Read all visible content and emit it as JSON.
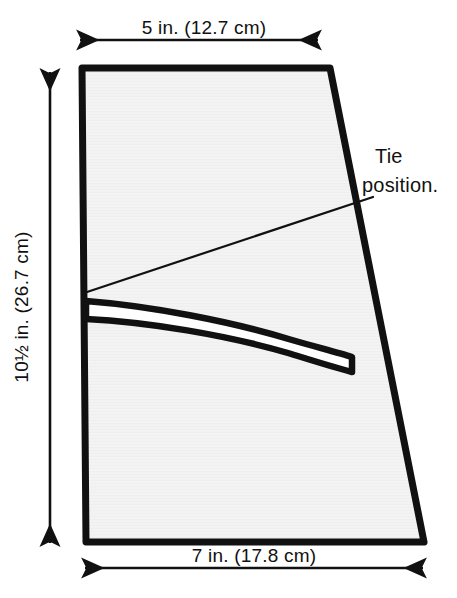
{
  "figure": {
    "background_color": "#ffffff",
    "ink_color": "#111111",
    "panel_fill_color": "#f2f2f2",
    "panel_stroke_color": "#111111"
  },
  "dimensions": {
    "top": {
      "label": "5 in. (12.7 cm)",
      "value_inches": "5",
      "value_cm": "12.7",
      "orientation": "horizontal",
      "arrow_style": "double-headed"
    },
    "left": {
      "label": "10½ in. (26.7 cm)",
      "label_whole": "10",
      "label_fraction": "½",
      "label_rest": " in. (26.7 cm)",
      "value_inches": "10.5",
      "value_cm": "26.7",
      "orientation": "vertical",
      "arrow_style": "double-headed"
    },
    "bottom": {
      "label": "7 in. (17.8 cm)",
      "value_inches": "7",
      "value_cm": "17.8",
      "orientation": "horizontal",
      "arrow_style": "double-headed"
    }
  },
  "annotations": {
    "tie": {
      "line1": "Tie",
      "line2": "position.",
      "full_text": "Tie position.",
      "leader": "thin-diagonal-line"
    }
  },
  "shapes": {
    "panel": {
      "name": "pattern-panel",
      "description": "Trapezoid panel, narrower at top, wider at bottom",
      "points": "82,68 330,68 424,542 86,542"
    },
    "tie_strip": {
      "name": "tie-strip",
      "description": "Tapered curved strip from left edge sloping down to the right",
      "outline": "86,303 160,310 240,324 300,340 350,352 352,370 298,356 236,340 156,326 86,319"
    },
    "leader_line": {
      "name": "tie-leader-line",
      "from": "87,292",
      "to": "373,197"
    }
  }
}
